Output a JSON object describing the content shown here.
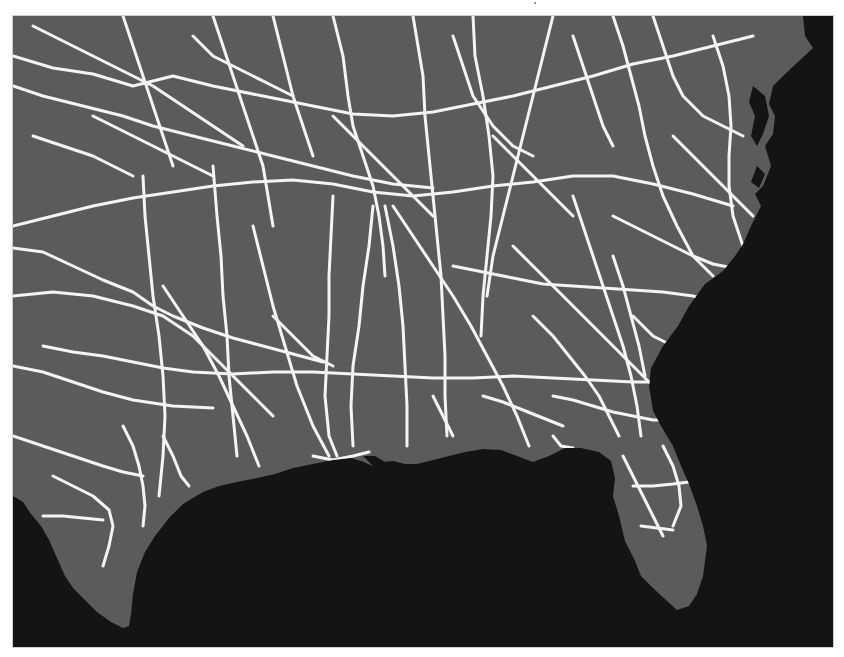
{
  "map": {
    "type": "road-network-basemap",
    "region": "Southeastern United States",
    "frame": {
      "x": 12,
      "y": 15,
      "width": 822,
      "height": 633
    },
    "colors": {
      "ocean": "#141414",
      "land": "#5b5b5b",
      "land_shadow": "#4a4a4a",
      "roads": "#f4f4f4",
      "frame_border": "#cfcfcf"
    },
    "land_polygon": "0,0 790,0 792,20 800,32 786,45 770,60 760,70 756,88 762,100 760,118 752,130 758,150 750,170 742,178 748,190 738,210 730,228 722,240 710,255 692,268 676,290 665,310 650,330 638,352 636,370 640,395 648,410 660,430 668,450 676,468 684,490 690,510 694,530 690,560 684,578 676,590 664,594 654,585 640,572 628,560 622,545 612,525 606,500 600,480 602,462 598,445 586,436 568,432 552,432 536,440 520,446 504,440 488,434 470,433 452,436 436,440 420,444 404,448 392,448 380,445 370,446 360,450 348,445 338,442 320,444 300,448 280,452 262,458 244,462 224,466 206,470 190,476 170,488 156,502 142,520 132,536 124,556 120,578 118,598 116,610 110,612 98,606 84,596 72,584 60,572 52,560 44,542 36,524 28,510 18,498 10,486 0,480",
    "delta_polygon": "350,440 358,448 366,456 362,464 372,470 380,462 388,466 384,452 372,446 362,440",
    "bays": [
      "740,70 752,80 756,100 750,118 744,130 738,120 742,100 736,86",
      "744,150 752,158 746,172 738,166",
      "748,195 756,200 752,212 744,206"
    ],
    "roads": [
      "0,40 40,52 80,58 120,70 160,60 200,70 250,80 300,90 340,98 380,100 420,96 460,88 500,80 540,70 580,60 620,48 660,40 700,30 740,20",
      "0,70 30,80 70,90 110,100 140,110 180,120 220,130 260,140 300,150 340,160 380,168 420,172",
      "20,10 60,30 100,50 140,70 170,90 200,110 230,130",
      "110,0 120,30 130,60 140,90 150,120 160,150",
      "200,0 210,30 220,60 230,90 240,120 250,150 255,180 260,210",
      "260,0 270,40 280,80 290,110 300,140",
      "320,0 330,40 335,80 340,110 350,140 360,170 366,200 370,230 372,260",
      "400,0 405,30 410,60 412,100 416,140 420,180 424,220 428,260 430,300 432,340 432,380 434,420",
      "460,0 462,40 470,80 476,120 480,160 478,200 474,240 470,280 468,320",
      "540,0 530,40 520,80 510,120 500,160 490,200 480,240 474,280",
      "600,0 610,30 618,60 626,90 632,120 640,150 650,180 664,210 680,240 700,260",
      "640,0 650,30 660,60 670,80 690,100 710,110 730,120",
      "700,20 710,50 716,80 718,110 716,140 716,170 720,200 730,230",
      "0,210 40,200 80,190 120,182 160,176 200,170 240,166 280,164 320,168 360,176 400,180 440,176 480,170 520,166 560,160 600,160 640,168 680,178 720,190",
      "0,232 30,236 60,250 90,264 120,276 140,290 160,300 190,312 220,322 250,330 280,338 310,346",
      "0,280 40,276 80,280 120,290 150,300 180,320 200,340 220,360 240,380 260,400",
      "30,330 60,336 90,340 120,346 150,352 180,356 220,358 260,356 300,356 340,358 380,360 420,362 460,362 500,360 540,362 580,364 620,366 650,366",
      "0,350 30,356 60,366 90,376 120,384 160,390 200,392",
      "130,160 132,200 136,240 140,280 146,320 150,360 152,400 150,440 146,480",
      "200,150 204,200 208,240 210,280 214,320 216,360 220,400 224,440",
      "150,270 170,300 190,330 206,360 220,390 234,420 246,450",
      "240,210 250,250 260,290 272,330 284,370 300,410 316,440",
      "320,180 318,220 316,260 316,300 314,340 312,380 316,420 324,440",
      "360,190 356,230 350,270 346,310 340,350 338,390 340,430",
      "372,190 380,230 386,270 390,310 392,350 394,390 394,430",
      "380,190 400,220 420,250 440,280 458,310 474,340 490,370 504,400 516,430",
      "500,230 520,250 540,270 560,290 580,310 600,330 620,350 640,370",
      "560,180 570,210 580,240 590,270 600,300 610,330 618,360 624,390 628,420",
      "600,200 620,210 640,220 660,230 680,240 700,248 720,252",
      "440,250 470,256 500,262 530,268 560,270 590,272 620,274 650,276 680,280 700,286",
      "600,240 610,270 618,300 626,330 632,360",
      "520,300 540,320 556,340 572,360 586,380 596,400 606,420",
      "540,380 560,384 580,390 600,396 620,400 640,404 660,404",
      "470,380 490,386 510,394 530,402 550,410",
      "0,420 30,430 60,440 90,450 110,456 130,460",
      "40,460 60,470 80,480 96,494 100,510 96,530 90,550",
      "110,410 120,430 126,450 130,470 132,490 130,510",
      "30,500 50,500 70,502 90,504",
      "150,420 160,440 168,460 176,470",
      "260,300 280,320 300,340 320,350",
      "80,100 100,110 120,120 140,130 160,140 180,150 200,160",
      "20,120 50,130 80,140 100,150 120,160",
      "180,20 200,40 220,50 240,60 260,70 280,80",
      "440,20 450,50 460,80 480,110 500,130 520,140",
      "560,20 570,50 580,80 590,110 600,130",
      "480,120 500,140 520,160 540,180 560,200",
      "320,100 340,120 360,140 380,160 400,180 420,200",
      "660,120 680,140 700,160 720,180 740,200",
      "620,300 640,320 660,330 680,340",
      "610,440 620,460 630,480 640,500 650,520",
      "650,430 660,450 666,470 668,490 660,510",
      "620,470 640,470 660,468 676,466",
      "628,510 644,512 660,514",
      "300,440 320,444 340,440 356,436",
      "420,380 430,400 440,420",
      "540,420 548,430 560,432"
    ]
  }
}
